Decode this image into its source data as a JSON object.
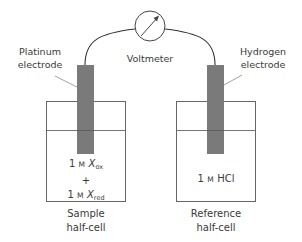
{
  "diagram": {
    "voltmeter": {
      "label": "Voltmeter",
      "icon": "voltmeter-dial-icon"
    },
    "left_electrode": {
      "label_line1": "Platinum",
      "label_line2": "electrode"
    },
    "right_electrode": {
      "label_line1": "Hydrogen",
      "label_line2": "electrode"
    },
    "left_cell": {
      "caption_line1": "Sample",
      "caption_line2": "half-cell",
      "solution": {
        "line1_conc": "1",
        "line1_unit": "M",
        "line1_species": "X",
        "line1_sub": "ox",
        "plus": "+",
        "line2_conc": "1",
        "line2_unit": "M",
        "line2_species": "X",
        "line2_sub": "red"
      }
    },
    "right_cell": {
      "caption_line1": "Reference",
      "caption_line2": "half-cell",
      "solution": {
        "conc": "1",
        "unit": "M",
        "species": "HCl"
      }
    },
    "colors": {
      "electrode_fill": "#7a7a7a",
      "outline": "#555555",
      "wire": "#333333",
      "text": "#3a3a3a"
    }
  }
}
